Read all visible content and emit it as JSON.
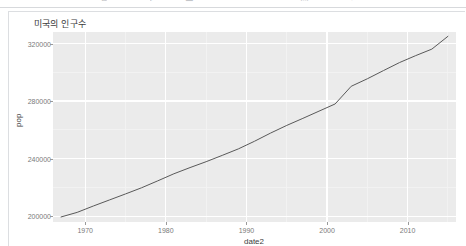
{
  "toolbar": {
    "icons": [
      {
        "name": "back-icon",
        "glyph": "←",
        "x": 6
      },
      {
        "name": "menu-icon",
        "glyph": "☰",
        "x": 34
      },
      {
        "name": "cut-icon",
        "glyph": "✂",
        "x": 74
      },
      {
        "name": "copy-icon",
        "glyph": "❐",
        "x": 88
      },
      {
        "name": "paste-icon",
        "glyph": "⎘",
        "x": 100
      },
      {
        "name": "run-icon",
        "glyph": "▶",
        "x": 150
      },
      {
        "name": "stop-icon",
        "glyph": "■",
        "x": 185
      },
      {
        "name": "save-icon",
        "glyph": "⬚",
        "x": 300
      },
      {
        "name": "settings-icon",
        "glyph": "⚙",
        "x": 348
      }
    ]
  },
  "chart_data": {
    "type": "line",
    "title": "미국의 인구수",
    "xlabel": "date2",
    "ylabel": "pop",
    "grid": true,
    "legend": "none",
    "xlim": [
      1966,
      2016
    ],
    "ylim": [
      196000,
      328000
    ],
    "xticks": [
      1970,
      1980,
      1990,
      2000,
      2010
    ],
    "xtick_labels": [
      "1970",
      "1980",
      "1990",
      "2000",
      "2010"
    ],
    "yticks": [
      200000,
      240000,
      280000,
      320000
    ],
    "ytick_labels": [
      "200000",
      "240000",
      "280000",
      "320000"
    ],
    "series": [
      {
        "name": "pop",
        "color": "#595959",
        "x": [
          1967,
          1969,
          1971,
          1973,
          1975,
          1977,
          1979,
          1981,
          1983,
          1985,
          1987,
          1989,
          1991,
          1993,
          1995,
          1997,
          1999,
          2001,
          2003,
          2005,
          2007,
          2009,
          2011,
          2013,
          2015
        ],
        "y": [
          199500,
          202700,
          207100,
          211300,
          215500,
          219800,
          224600,
          229500,
          233800,
          237900,
          242300,
          246800,
          252100,
          257800,
          263100,
          268000,
          273000,
          278000,
          290300,
          295500,
          301200,
          306800,
          311600,
          316100,
          325000
        ]
      }
    ]
  }
}
